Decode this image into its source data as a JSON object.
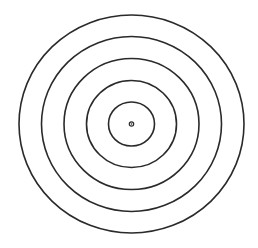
{
  "diagram": {
    "type": "concentric-circles",
    "center": {
      "cx": 131.5,
      "cy": 124
    },
    "rings": [
      {
        "rx": 112.5,
        "ry": 109
      },
      {
        "rx": 90,
        "ry": 87.5
      },
      {
        "rx": 67.5,
        "ry": 65.5
      },
      {
        "rx": 45,
        "ry": 43.5
      },
      {
        "rx": 23,
        "ry": 22
      }
    ],
    "center_dot": {
      "r_outer": 2.2,
      "r_inner": 0.8
    },
    "colors": {
      "stroke": "#2a2a2a",
      "background": "#ffffff"
    },
    "stroke_width": 1.6
  }
}
